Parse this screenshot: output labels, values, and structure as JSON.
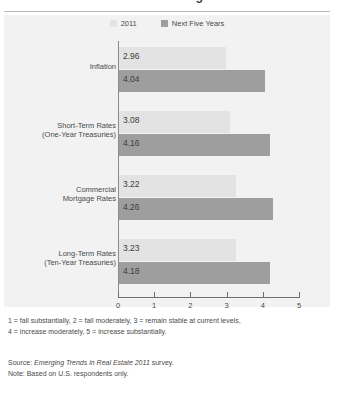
{
  "title": "Inflation and Interest Rate Changes",
  "legend": {
    "items": [
      {
        "label": "2011",
        "color": "#e3e3e3"
      },
      {
        "label": "Next Five Years",
        "color": "#9e9e9e"
      }
    ]
  },
  "axis": {
    "ticks": [
      "0",
      "1",
      "2",
      "3",
      "4",
      "5"
    ]
  },
  "notes": {
    "scale_line1": "1 = fall substantially, 2 = fall moderately, 3 = remain stable at current levels,",
    "scale_line2": "4 = increase moderately, 5 = increase substantially."
  },
  "source": {
    "prefix": "Source: ",
    "italic": "Emerging Trends in Real Estate 2011",
    "suffix": " survey.",
    "note": "Note: Based on U.S. respondents only."
  },
  "chart_data": {
    "type": "bar",
    "orientation": "horizontal",
    "title": "Inflation and Interest Rate Changes",
    "xlabel": "",
    "ylabel": "",
    "xlim": [
      0,
      5
    ],
    "xticks": [
      0,
      1,
      2,
      3,
      4,
      5
    ],
    "grid": false,
    "legend_position": "top-center",
    "categories": [
      "Inflation",
      "Short-Term Rates (One-Year Treasuries)",
      "Commercial Mortgage Rates",
      "Long-Term Rates (Ten-Year Treasuries)"
    ],
    "category_lines": [
      [
        "Inflation",
        ""
      ],
      [
        "Short-Term Rates",
        "(One-Year Treasuries)"
      ],
      [
        "Commercial",
        "Mortgage Rates"
      ],
      [
        "Long-Term Rates",
        "(Ten-Year Treasuries)"
      ]
    ],
    "series": [
      {
        "name": "2011",
        "color": "#e3e3e3",
        "values": [
          2.96,
          3.08,
          3.22,
          3.23
        ],
        "labels": [
          "2.96",
          "3.08",
          "3.22",
          "3.23"
        ]
      },
      {
        "name": "Next Five Years",
        "color": "#9e9e9e",
        "values": [
          4.04,
          4.16,
          4.26,
          4.18
        ],
        "labels": [
          "4.04",
          "4.16",
          "4.26",
          "4.18"
        ]
      }
    ],
    "scale_note": "1 = fall substantially, 2 = fall moderately, 3 = remain stable at current levels, 4 = increase moderately, 5 = increase substantially.",
    "source": "Source: Emerging Trends in Real Estate 2011 survey.",
    "note": "Note: Based on U.S. respondents only."
  }
}
